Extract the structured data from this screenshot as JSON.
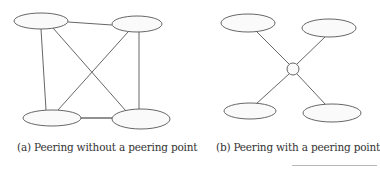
{
  "figures": [
    {
      "id": "a",
      "caption": "(a) Peering without a peering point",
      "nodes": [
        {
          "name": "top-left",
          "cx": 41,
          "cy": 21,
          "rx": 27,
          "ry": 8
        },
        {
          "name": "top-right",
          "cx": 137,
          "cy": 24,
          "rx": 25,
          "ry": 8
        },
        {
          "name": "bottom-left",
          "cx": 52,
          "cy": 118,
          "rx": 29,
          "ry": 8
        },
        {
          "name": "bottom-right",
          "cx": 141,
          "cy": 119,
          "rx": 29,
          "ry": 10
        }
      ],
      "edges": [
        {
          "from": "top-left",
          "to": "top-right"
        },
        {
          "from": "top-left",
          "to": "bottom-left"
        },
        {
          "from": "top-left",
          "to": "bottom-right"
        },
        {
          "from": "top-right",
          "to": "bottom-left"
        },
        {
          "from": "top-right",
          "to": "bottom-right"
        },
        {
          "from": "bottom-left",
          "to": "bottom-right"
        }
      ]
    },
    {
      "id": "b",
      "caption": "(b) Peering with a peering point",
      "hub": {
        "name": "peering-point",
        "cx": 293,
        "cy": 69,
        "r": 6
      },
      "nodes": [
        {
          "name": "top-left",
          "cx": 248,
          "cy": 23,
          "rx": 27,
          "ry": 9
        },
        {
          "name": "top-right",
          "cx": 329,
          "cy": 28,
          "rx": 27,
          "ry": 9
        },
        {
          "name": "bottom-left",
          "cx": 250,
          "cy": 111,
          "rx": 26,
          "ry": 8
        },
        {
          "name": "bottom-right",
          "cx": 332,
          "cy": 113,
          "rx": 29,
          "ry": 9
        }
      ],
      "edges": [
        {
          "from": "top-left",
          "to": "peering-point"
        },
        {
          "from": "top-right",
          "to": "peering-point"
        },
        {
          "from": "bottom-left",
          "to": "peering-point"
        },
        {
          "from": "bottom-right",
          "to": "peering-point"
        }
      ]
    }
  ],
  "colors": {
    "stroke": "#555555",
    "fill": "#fafafa",
    "text": "#333333"
  }
}
